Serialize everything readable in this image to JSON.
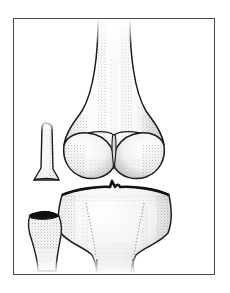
{
  "page": {
    "background_color": "#ffffff",
    "width": 230,
    "height": 293
  },
  "plate": {
    "frame_color": "#4a4a4a",
    "frame_style": "thin rectangular border",
    "interior_color": "#ffffff",
    "name": "anatomical-plate"
  },
  "illustration": {
    "name": "knee-joint-anterior-view",
    "medium": "stipple-and-line pen drawing",
    "view": "anterior",
    "subject": "human knee joint",
    "ink_color": "#1a1a1a",
    "stipple_color": "#5a5a5a",
    "bone_fill": "#fbfbfb",
    "shadow_color": "#111111",
    "structures": [
      {
        "name": "femur-shaft",
        "label": "femoral shaft",
        "description": "vertical diaphysis entering frame from top, fading at cut edge"
      },
      {
        "name": "femur-lateral-condyle",
        "label": "lateral femoral condyle",
        "description": "rounded distal femoral prominence, viewer left"
      },
      {
        "name": "femur-medial-condyle",
        "label": "medial femoral condyle",
        "description": "rounded distal femoral prominence, viewer right"
      },
      {
        "name": "intercondylar-notch",
        "label": "intercondylar notch",
        "description": "central groove between the two femoral condyles"
      },
      {
        "name": "patella",
        "label": "patella",
        "description": "narrow bone seen edge-on at left, tapering to an apex"
      },
      {
        "name": "joint-space",
        "label": "knee joint space",
        "description": "gap between femoral condyles and tibial plateau"
      },
      {
        "name": "tibial-plateau",
        "label": "tibial plateau",
        "description": "broad flat superior surface of tibia with intercondylar eminence"
      },
      {
        "name": "tibia-shaft",
        "label": "tibial shaft",
        "description": "shaft narrowing below the plateau, fading at bottom cut edge"
      },
      {
        "name": "fibula-head",
        "label": "head of fibula",
        "description": "small bone at lower left with dark articular shadow"
      }
    ]
  }
}
